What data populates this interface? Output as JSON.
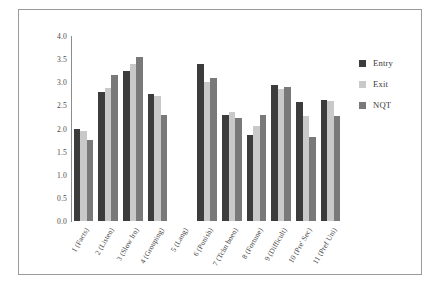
{
  "chart_data": {
    "type": "bar",
    "title": "",
    "xlabel": "",
    "ylabel": "",
    "ylim": [
      0.0,
      4.0
    ],
    "yticks": [
      "0.0",
      "0.5",
      "1.0",
      "1.5",
      "2.0",
      "2.5",
      "3.0",
      "3.5",
      "4.0"
    ],
    "ytick_values": [
      0.0,
      0.5,
      1.0,
      1.5,
      2.0,
      2.5,
      3.0,
      3.5,
      4.0
    ],
    "grid": false,
    "legend_position": "right",
    "categories": [
      "1 (Facts)",
      "2 (Listen)",
      "3 (Slow lrn)",
      "4 (Grouping)",
      "5 (Lang)",
      "6 (Punish)",
      "7 (Tchn boen)",
      "8 (Fortune)",
      "9 (Difficult)",
      "10 (Pre' Sec)",
      "11 (Pref Uni)"
    ],
    "series": [
      {
        "name": "Entry",
        "color": "#3c3c3c",
        "values": [
          2.0,
          2.8,
          3.25,
          2.75,
          null,
          3.4,
          2.3,
          1.87,
          2.95,
          2.57,
          2.62
        ]
      },
      {
        "name": "Exit",
        "color": "#c9c9c9",
        "values": [
          1.95,
          2.87,
          3.4,
          2.7,
          null,
          3.0,
          2.35,
          2.05,
          2.85,
          2.27,
          2.6
        ]
      },
      {
        "name": "NQT",
        "color": "#797979",
        "values": [
          1.75,
          3.15,
          3.55,
          2.3,
          null,
          3.1,
          2.22,
          2.3,
          2.9,
          1.82,
          2.28
        ]
      }
    ]
  }
}
